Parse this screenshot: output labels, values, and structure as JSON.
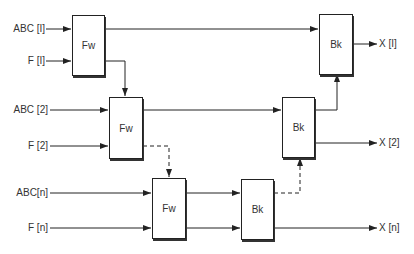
{
  "diagram": {
    "inputs": [
      {
        "abc": "ABC [I]",
        "f": "F [I]"
      },
      {
        "abc": "ABC [2]",
        "f": "F [2]"
      },
      {
        "abc": "ABC[n]",
        "f": "F [n]"
      }
    ],
    "forward_blocks": [
      "Fw",
      "Fw",
      "Fw"
    ],
    "backward_blocks": [
      "Bk",
      "Bk",
      "Bk"
    ],
    "outputs": [
      "X [I]",
      "X [2]",
      "X [n]"
    ],
    "edges": [
      {
        "from": "ABC[1]",
        "to": "Fw1",
        "style": "solid"
      },
      {
        "from": "F[1]",
        "to": "Fw1",
        "style": "solid"
      },
      {
        "from": "Fw1",
        "to": "Bk1",
        "style": "solid"
      },
      {
        "from": "Fw1",
        "to": "Fw2",
        "style": "solid"
      },
      {
        "from": "ABC[2]",
        "to": "Fw2",
        "style": "solid"
      },
      {
        "from": "F[2]",
        "to": "Fw2",
        "style": "solid"
      },
      {
        "from": "Fw2",
        "to": "Bk2",
        "style": "solid"
      },
      {
        "from": "Fw2",
        "to": "Fw3",
        "style": "dashed"
      },
      {
        "from": "ABC[n]",
        "to": "Fw3",
        "style": "solid"
      },
      {
        "from": "F[n]",
        "to": "Fw3",
        "style": "solid"
      },
      {
        "from": "Fw3",
        "to": "Bk3",
        "style": "solid"
      },
      {
        "from": "Fw3",
        "to": "Bk3",
        "style": "solid"
      },
      {
        "from": "Bk3",
        "to": "Bk2",
        "style": "dashed"
      },
      {
        "from": "Bk3",
        "to": "X[n]",
        "style": "solid"
      },
      {
        "from": "Bk2",
        "to": "Bk1",
        "style": "solid"
      },
      {
        "from": "Bk2",
        "to": "X[2]",
        "style": "solid"
      },
      {
        "from": "Bk1",
        "to": "X[1]",
        "style": "solid"
      }
    ]
  }
}
